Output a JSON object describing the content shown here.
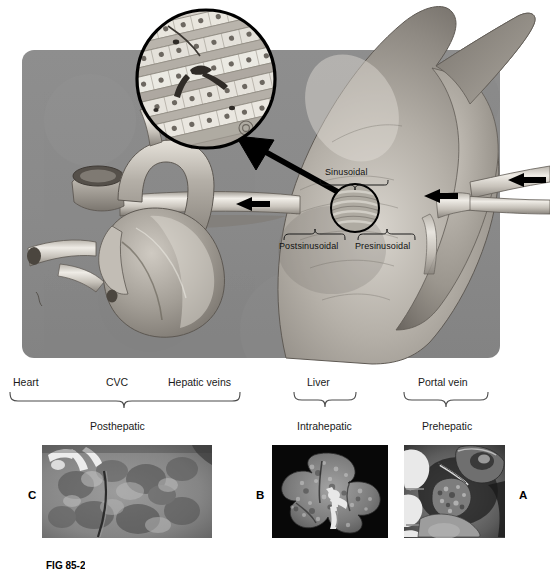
{
  "figure": {
    "caption": "FIG 85-2",
    "background_color": "#ffffff",
    "panel_color": "#8a8a8a"
  },
  "illustration": {
    "name": "portal-hypertension-anatomy",
    "description": "Anatomic drawing of heart, caudal vena cava, liver and portal vein with magnified hepatic sinusoid inset",
    "labels": [
      {
        "id": "sinusoidal",
        "text": "Sinusoidal"
      },
      {
        "id": "postsinusoidal",
        "text": "Postsinusoidal"
      },
      {
        "id": "presinusoidal",
        "text": "Presinusoidal"
      }
    ],
    "flow_arrows": [
      {
        "id": "hepatic-vein-flow",
        "direction": "left"
      },
      {
        "id": "portal-vein-flow-inner",
        "direction": "left"
      },
      {
        "id": "portal-vein-flow-outer",
        "direction": "left"
      }
    ],
    "inset": {
      "id": "sinusoid-histology-inset",
      "description": "Magnified hepatic sinusoid with hepatocyte cords"
    }
  },
  "bands": {
    "vessel_labels": [
      {
        "id": "heart",
        "text": "Heart"
      },
      {
        "id": "cvc",
        "text": "CVC"
      },
      {
        "id": "hepatic-veins",
        "text": "Hepatic veins"
      },
      {
        "id": "liver",
        "text": "Liver"
      },
      {
        "id": "portal-vein",
        "text": "Portal vein"
      }
    ],
    "categories": [
      {
        "id": "posthepatic",
        "text": "Posthepatic"
      },
      {
        "id": "intrahepatic",
        "text": "Intrahepatic"
      },
      {
        "id": "prehepatic",
        "text": "Prehepatic"
      }
    ]
  },
  "photos": [
    {
      "id": "photo-c",
      "letter": "C",
      "category": "Posthepatic",
      "description": "Gross photograph of mottled congested liver surface"
    },
    {
      "id": "photo-b",
      "letter": "B",
      "category": "Intrahepatic",
      "description": "Gross specimen of cirrhotic liver on black background"
    },
    {
      "id": "photo-a",
      "letter": "A",
      "category": "Prehepatic",
      "description": "Intraoperative photograph of prehepatic portal vein region"
    }
  ]
}
